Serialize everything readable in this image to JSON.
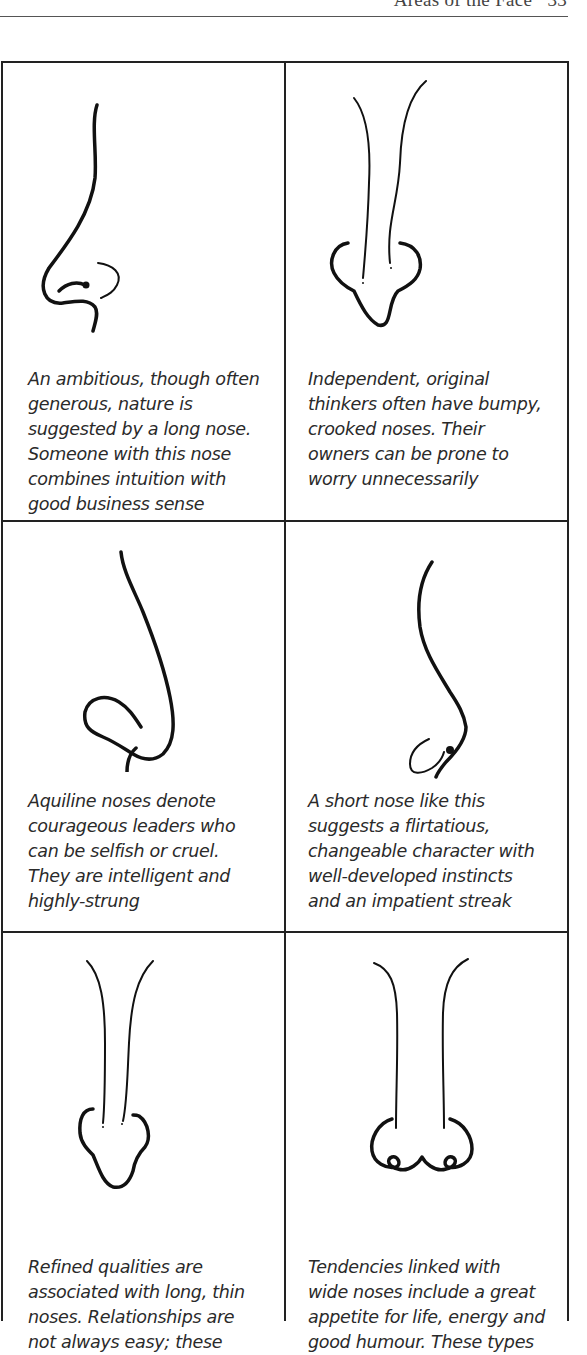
{
  "page": {
    "running_head": "Areas of the Face",
    "page_number": "33"
  },
  "cells": [
    {
      "position": "row-1-left",
      "illustration": "long-nose-profile-icon",
      "lines": [
        "An ambitious, though often",
        "generous, nature is",
        "suggested by a long nose.",
        "Someone with this nose",
        "combines intuition with",
        "good business sense"
      ]
    },
    {
      "position": "row-1-right",
      "illustration": "bumpy-crooked-nose-front-icon",
      "lines": [
        "Independent, original",
        "thinkers often have bumpy,",
        "crooked noses. Their",
        "owners can be prone to",
        "worry unnecessarily"
      ]
    },
    {
      "position": "row-2-left",
      "illustration": "aquiline-nose-profile-icon",
      "lines": [
        "Aquiline noses denote",
        "courageous leaders who",
        "can be selfish or cruel.",
        "They are intelligent and",
        "highly-strung"
      ]
    },
    {
      "position": "row-2-right",
      "illustration": "short-nose-profile-icon",
      "lines": [
        "A short nose like this",
        "suggests a flirtatious,",
        "changeable character with",
        "well-developed instincts",
        "and an impatient streak"
      ]
    },
    {
      "position": "row-3-left",
      "illustration": "long-thin-nose-front-icon",
      "lines": [
        "Refined qualities are",
        "associated with long, thin",
        "noses. Relationships are",
        "not always easy; these"
      ]
    },
    {
      "position": "row-3-right",
      "illustration": "wide-nose-front-icon",
      "lines": [
        "Tendencies linked with",
        "wide noses include a great",
        "appetite for life, energy and",
        "good humour. These types"
      ]
    }
  ]
}
